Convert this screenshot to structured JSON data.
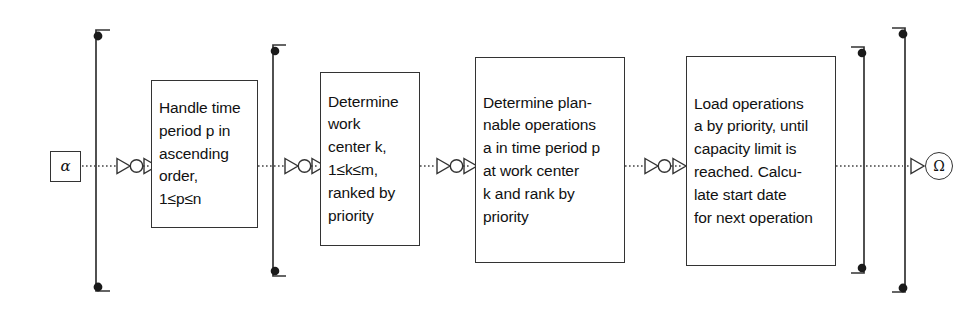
{
  "diagram": {
    "type": "process-flow-diagram",
    "title": "Capacity planning process flow",
    "canvas": {
      "width": 971,
      "height": 316,
      "background": "#ffffff"
    },
    "line_color": "#333333",
    "text_color": "#111111",
    "terminals": {
      "start": {
        "symbol": "α",
        "name": "alpha",
        "shape": "square"
      },
      "end": {
        "symbol": "Ω",
        "name": "omega",
        "shape": "circle"
      }
    },
    "steps": [
      {
        "id": "box-1",
        "index": 1,
        "text": "Handle time\nperiod p in\nascending\norder,\n1≤p≤n"
      },
      {
        "id": "box-2",
        "index": 2,
        "text": "Determine\nwork\ncenter k,\n1≤k≤m,\nranked by\npriority"
      },
      {
        "id": "box-3",
        "index": 3,
        "text": "Determine plan-\nnable operations\na in time period p\nat work center\nk and rank by\npriority"
      },
      {
        "id": "box-4",
        "index": 4,
        "text": "Load operations\na by priority, until\ncapacity limit is\nreached. Calcu-\nlate start date\nfor next operation"
      }
    ],
    "connectors": [
      {
        "id": "connector-start",
        "from": "start-terminal",
        "to": "box-1",
        "style": "dotted",
        "markers": "triangle-circle-triangle"
      },
      {
        "id": "connector-1-2",
        "from": "box-1",
        "to": "box-2",
        "style": "dotted",
        "markers": "triangle-circle-triangle"
      },
      {
        "id": "connector-2-3",
        "from": "box-2",
        "to": "box-3",
        "style": "dotted",
        "markers": "triangle-circle-triangle"
      },
      {
        "id": "connector-3-4",
        "from": "box-3",
        "to": "box-4",
        "style": "dotted",
        "markers": "triangle-circle-triangle"
      },
      {
        "id": "connector-end",
        "from": "box-4",
        "to": "end-terminal",
        "style": "dotted",
        "markers": "triangle"
      }
    ],
    "loop_rails": [
      {
        "id": "loop-rail-outer-left",
        "side": "left",
        "x": 96,
        "top": 28,
        "bottom": 293,
        "dots": 2
      },
      {
        "id": "loop-rail-inner-left",
        "side": "left",
        "x": 273,
        "top": 44,
        "bottom": 277,
        "dots": 2
      },
      {
        "id": "loop-rail-inner-right",
        "side": "right",
        "x": 864,
        "top": 46,
        "bottom": 274,
        "dots": 2
      },
      {
        "id": "loop-rail-outer-right",
        "side": "right",
        "x": 905,
        "top": 26,
        "bottom": 294,
        "dots": 2
      }
    ]
  }
}
